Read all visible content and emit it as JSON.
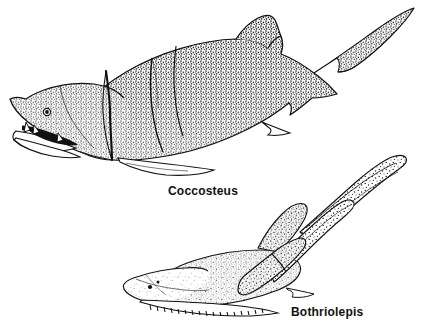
{
  "figure": {
    "kind": "scientific-illustration",
    "technique": "pen-and-ink stipple line drawing",
    "background_color": "#ffffff",
    "ink_color": "#111111",
    "width": 433,
    "height": 336
  },
  "labels": {
    "upper": "Coccosteus",
    "lower": "Bothriolepis"
  },
  "specimens": [
    {
      "name": "Coccosteus",
      "position": "upper-left",
      "orientation": "facing lower-left, tail upper-right",
      "features": [
        "armored head shield",
        "eye",
        "open jaw with tooth plates",
        "trunk armor plate seams",
        "dorsal fin",
        "pectoral fin",
        "anal fin",
        "heterocercal tail"
      ]
    },
    {
      "name": "Bothriolepis",
      "position": "lower-right",
      "orientation": "facing lower-left, tail upper-right",
      "features": [
        "flat armored head shield",
        "small eye",
        "serrated ventral plate margin",
        "long jointed pectoral appendages",
        "dorsal fin",
        "slender tapering tail"
      ]
    }
  ]
}
